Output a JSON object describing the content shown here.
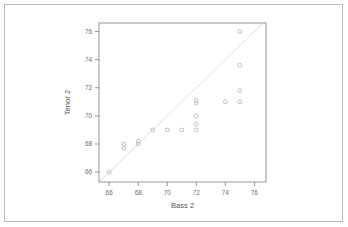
{
  "figure": {
    "kind": "scatter-plot",
    "background_color": "#ffffff",
    "outer_border_color": "#b9b9b9",
    "axis_color": "#8a8a8a",
    "point_color": "#b5b5b5",
    "refline_color": "#dedede"
  },
  "chart_data": {
    "type": "scatter",
    "title": "",
    "xlabel": "Bass 2",
    "ylabel": "Tenor 2",
    "xlim": [
      65.3,
      76.8
    ],
    "ylim": [
      65.3,
      76.6
    ],
    "xticks": [
      66,
      68,
      70,
      72,
      74,
      76
    ],
    "yticks": [
      66,
      68,
      70,
      72,
      74,
      76
    ],
    "xtick_labels": [
      "66",
      "68",
      "70",
      "72",
      "74",
      "76"
    ],
    "ytick_labels": [
      "66",
      "68",
      "70",
      "72",
      "74",
      "76"
    ],
    "grid": false,
    "legend": null,
    "marker": "open-circle",
    "reference_line": {
      "kind": "identity",
      "description": "y = x diagonal",
      "from": [
        65.3,
        65.3
      ],
      "to": [
        76.8,
        76.8
      ]
    },
    "points": [
      {
        "x": 66.0,
        "y": 66.0
      },
      {
        "x": 67.0,
        "y": 68.0
      },
      {
        "x": 67.0,
        "y": 67.7
      },
      {
        "x": 68.0,
        "y": 68.2
      },
      {
        "x": 68.0,
        "y": 68.0
      },
      {
        "x": 69.0,
        "y": 69.0
      },
      {
        "x": 70.0,
        "y": 69.0
      },
      {
        "x": 71.0,
        "y": 69.0
      },
      {
        "x": 72.0,
        "y": 71.1
      },
      {
        "x": 72.0,
        "y": 70.9
      },
      {
        "x": 72.0,
        "y": 70.0
      },
      {
        "x": 72.0,
        "y": 69.4
      },
      {
        "x": 72.0,
        "y": 69.0
      },
      {
        "x": 74.0,
        "y": 71.0
      },
      {
        "x": 75.0,
        "y": 76.0
      },
      {
        "x": 75.0,
        "y": 73.6
      },
      {
        "x": 75.0,
        "y": 71.8
      },
      {
        "x": 75.0,
        "y": 71.0
      }
    ]
  }
}
